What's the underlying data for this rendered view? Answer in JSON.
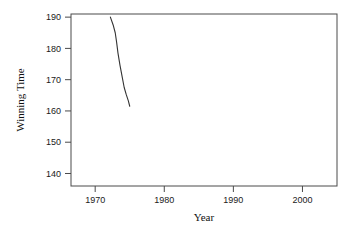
{
  "chart_data": {
    "type": "line",
    "title": "",
    "xlabel": "Year",
    "ylabel": "Winning Time",
    "xlim": [
      1966.5,
      2005.0
    ],
    "ylim": [
      136.0,
      191.0
    ],
    "xticks": [
      1970,
      1980,
      1990,
      2000
    ],
    "xtick_labels": [
      "1970",
      "1980",
      "1990",
      "2000"
    ],
    "yticks": [
      140,
      150,
      160,
      170,
      180,
      190
    ],
    "ytick_labels": [
      "140",
      "150",
      "160",
      "170",
      "180",
      "190"
    ],
    "grid": false,
    "legend": false,
    "series": [
      {
        "name": "Winning Time",
        "color": "#333333",
        "x": [
          1972.2,
          1972.6,
          1972.9,
          1973.1,
          1973.3,
          1973.6,
          1973.9,
          1974.2,
          1974.5,
          1974.8,
          1975.0
        ],
        "y": [
          190.0,
          187.5,
          185.0,
          182.0,
          178.5,
          174.5,
          171.0,
          167.5,
          165.2,
          163.2,
          161.5
        ]
      }
    ]
  },
  "axes": {
    "x_title": "Year",
    "y_title": "Winning Time"
  }
}
